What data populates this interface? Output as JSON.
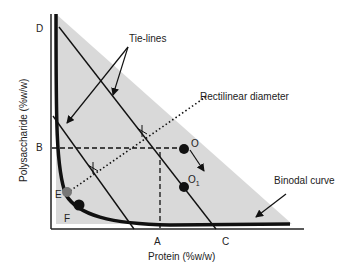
{
  "diagram": {
    "x_axis_label": "Protein (%w/w)",
    "y_axis_label": "Polysaccharide (%w/w)",
    "point_labels": {
      "D": "D",
      "B": "B",
      "E": "E",
      "F": "F",
      "A": "A",
      "C": "C",
      "O": "O",
      "O1_main": "O",
      "O1_sub": "1"
    },
    "annotations": {
      "tie_lines": "Tie-lines",
      "rectilinear_diameter": "Rectilinear diameter",
      "binodal_curve": "Binodal curve"
    },
    "colors": {
      "two_phase_region": "#d9d9d9",
      "lines": "#111111",
      "point_E": "#777777",
      "points": "#111111"
    }
  }
}
